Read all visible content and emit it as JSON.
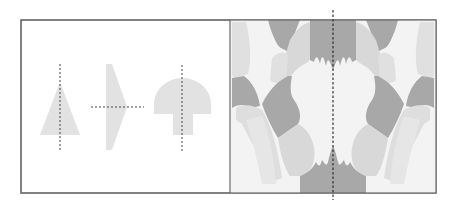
{
  "figure": {
    "topic": "lines of symmetry",
    "panels": [
      {
        "id": "left",
        "description": "three simple shapes, each with a dashed line of symmetry",
        "shapes": [
          {
            "name": "triangle",
            "axis": "vertical"
          },
          {
            "name": "arrowhead-pentagon",
            "axis": "horizontal"
          },
          {
            "name": "mushroom",
            "axis": "vertical"
          }
        ]
      },
      {
        "id": "right",
        "description": "mirror-symmetric abstract gray pattern with vertical dashed line of symmetry",
        "axis": "vertical"
      }
    ],
    "colors": {
      "background": "#ffffff",
      "border": "#6a6a6a",
      "shape_fill": "#e2e2e2",
      "pattern_lightest": "#f3f3f3",
      "pattern_light": "#e0e0e0",
      "pattern_mid": "#d2d2d2",
      "pattern_dark": "#a8a8a8",
      "axis_line": "#444444"
    }
  }
}
